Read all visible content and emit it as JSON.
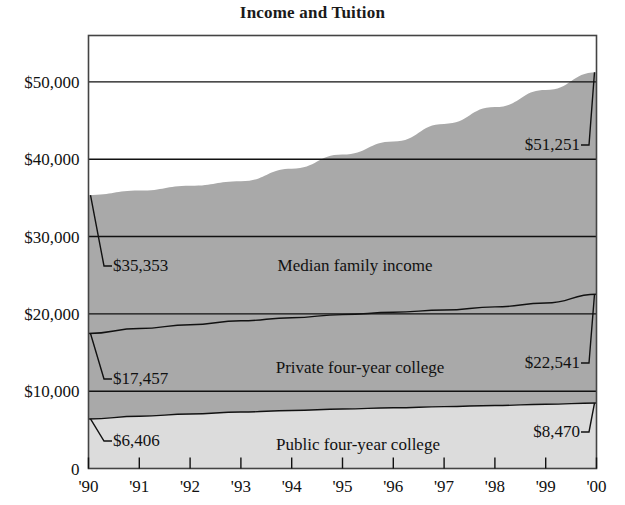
{
  "chart_data": {
    "type": "area",
    "title": "Income and Tuition",
    "xlabel": "",
    "ylabel": "",
    "stacked": false,
    "grid": true,
    "legend_position": "inline",
    "x": [
      1990,
      1991,
      1992,
      1993,
      1994,
      1995,
      1996,
      1997,
      1998,
      1999,
      2000
    ],
    "categories": [
      "'90",
      "'91",
      "'92",
      "'93",
      "'94",
      "'95",
      "'96",
      "'97",
      "'98",
      "'99",
      "'00"
    ],
    "ylim": [
      0,
      56000
    ],
    "ytick_values": [
      0,
      10000,
      20000,
      30000,
      40000,
      50000
    ],
    "ytick_labels": [
      "0",
      "$10,000",
      "$20,000",
      "$30,000",
      "$40,000",
      "$50,000"
    ],
    "series": [
      {
        "name": "Median family income",
        "color": "#a9a9a9",
        "values": [
          35353,
          35939,
          36573,
          37161,
          38782,
          40611,
          42300,
          44568,
          46737,
          48950,
          51251
        ],
        "start_value": 35353,
        "end_value": 51251,
        "start_label": "$35,353",
        "end_label": "$51,251"
      },
      {
        "name": "Private four-year college",
        "color": "#a9a9a9",
        "values": [
          17457,
          18100,
          18600,
          19100,
          19500,
          19900,
          20200,
          20500,
          20900,
          21400,
          22541
        ],
        "start_value": 17457,
        "end_value": 22541,
        "start_label": "$17,457",
        "end_label": "$22,541"
      },
      {
        "name": "Public four-year college",
        "color": "#dcdcdc",
        "values": [
          6406,
          6750,
          7050,
          7300,
          7500,
          7700,
          7850,
          8000,
          8150,
          8300,
          8470
        ],
        "start_value": 6406,
        "end_value": 8470,
        "start_label": "$6,406",
        "end_label": "$8,470"
      }
    ]
  }
}
